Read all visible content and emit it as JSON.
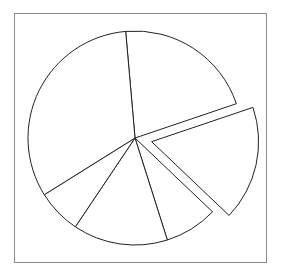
{
  "chart_data": {
    "type": "pie",
    "title": "",
    "labels": [
      "",
      "",
      "",
      "",
      "",
      ""
    ],
    "values": [
      21.2,
      17.3,
      8.0,
      14.3,
      6.7,
      32.5
    ],
    "start_angle_deg": -95,
    "direction": "clockwise",
    "exploded": [
      false,
      true,
      false,
      false,
      false,
      false
    ],
    "explode_offset_px": 17,
    "legend": "none",
    "fill_color": "#ffffff",
    "edge_color": "#222222",
    "frame_color": "#8a8a8a"
  }
}
